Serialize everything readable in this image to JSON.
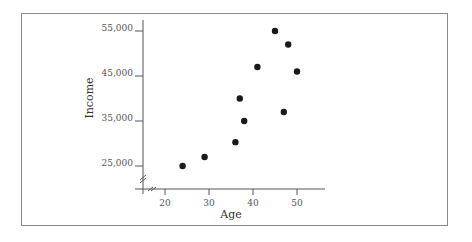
{
  "chart_data": {
    "type": "scatter",
    "title": "",
    "xlabel": "Age",
    "ylabel": "Income",
    "xlim": [
      15,
      57
    ],
    "ylim": [
      18000,
      57000
    ],
    "x_ticks": [
      20,
      30,
      40,
      50
    ],
    "x_tick_labels": [
      "20",
      "30",
      "40",
      "50"
    ],
    "y_ticks": [
      25000,
      35000,
      45000,
      55000
    ],
    "y_tick_labels": [
      "25,000",
      "35,000",
      "45,000",
      "55,000"
    ],
    "axis_breaks": true,
    "grid": false,
    "legend": null,
    "points": [
      {
        "x": 24,
        "y": 25000
      },
      {
        "x": 29,
        "y": 27000
      },
      {
        "x": 36,
        "y": 30300
      },
      {
        "x": 38,
        "y": 35000
      },
      {
        "x": 37,
        "y": 40000
      },
      {
        "x": 41,
        "y": 47000
      },
      {
        "x": 45,
        "y": 55000
      },
      {
        "x": 48,
        "y": 52000
      },
      {
        "x": 50,
        "y": 46000
      },
      {
        "x": 47,
        "y": 37000
      }
    ],
    "marker_color": "#1a1a1a"
  }
}
